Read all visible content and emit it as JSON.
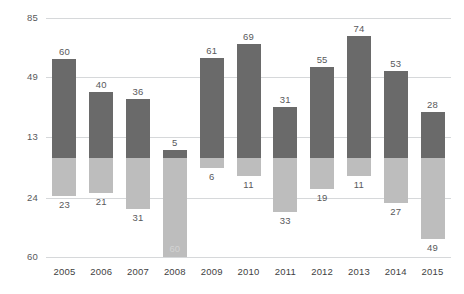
{
  "chart_data": {
    "type": "bar",
    "title": "",
    "subtitle": "",
    "xlabel": "",
    "ylabel": "",
    "categories": [
      "2005",
      "2006",
      "2007",
      "2008",
      "2009",
      "2010",
      "2011",
      "2012",
      "2013",
      "2014",
      "2015"
    ],
    "series": [
      {
        "name": "positive",
        "color": "#6a6a6a",
        "values": [
          60,
          40,
          36,
          5,
          61,
          69,
          31,
          55,
          74,
          53,
          28
        ],
        "labels": [
          "60",
          "40",
          "36",
          "5",
          "61",
          "69",
          "31",
          "55",
          "74",
          "53",
          "28"
        ]
      },
      {
        "name": "negative",
        "color": "#bdbdbd",
        "values": [
          -23,
          -21,
          -31,
          -60,
          -6,
          -11,
          -33,
          -19,
          -11,
          -27,
          -49
        ],
        "labels": [
          "23",
          "21",
          "31",
          "60",
          "6",
          "11",
          "33",
          "19",
          "11",
          "27",
          "49"
        ]
      }
    ],
    "ytick_values": [
      85,
      49,
      13,
      -24,
      -60
    ],
    "ytick_labels": [
      "85",
      "49",
      "13",
      "24",
      "60"
    ],
    "ylim": [
      -60,
      85
    ],
    "grid": true,
    "legend": "none",
    "gridline_color": "#d6d8da",
    "background": "#ffffff"
  }
}
